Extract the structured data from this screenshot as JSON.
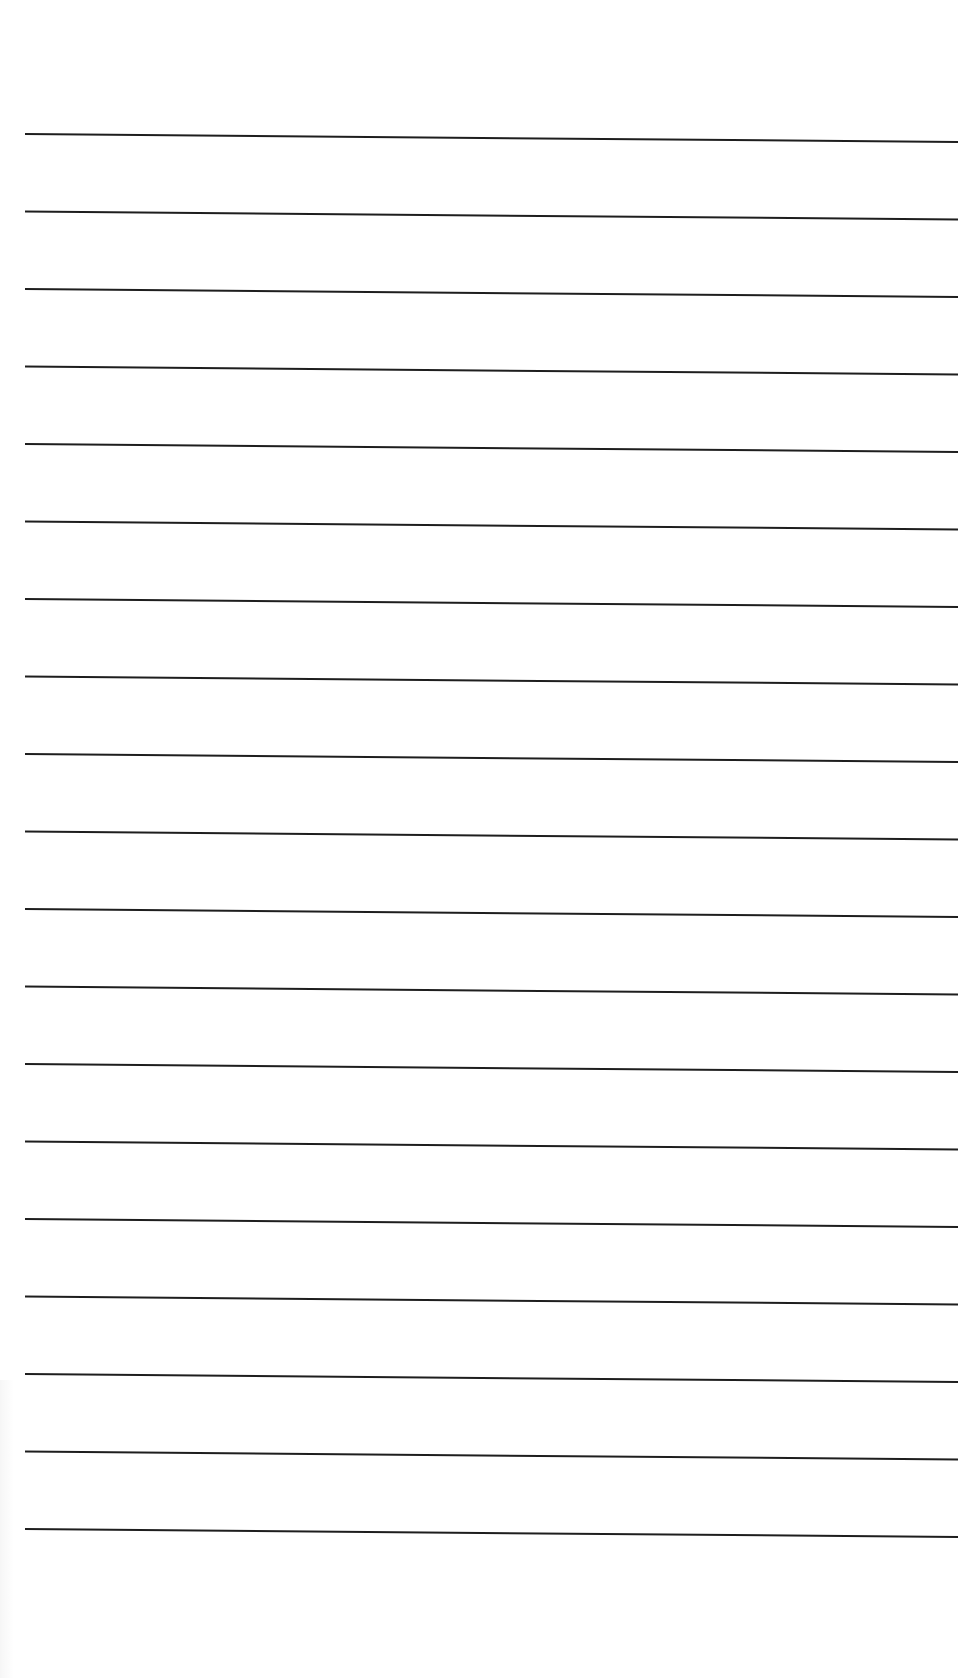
{
  "document": {
    "type": "ruled-paper",
    "background_color": "#ffffff",
    "line_color": "#1e1e1e",
    "line_count": 19,
    "line_thickness_px": 2,
    "first_line_y_px": 134,
    "line_spacing_px": 77.5,
    "line_start_x_px": 25,
    "line_end_x_px": 958,
    "line_slope_drop_px": 8,
    "text_content": []
  }
}
